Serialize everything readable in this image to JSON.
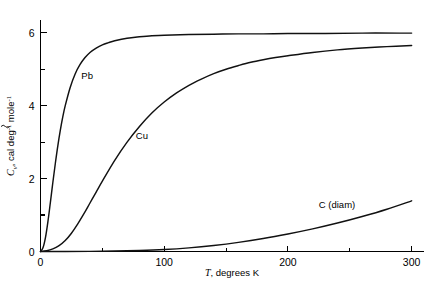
{
  "figure": {
    "name": "heat-capacity-vs-temperature",
    "background": "#ffffff",
    "curve_color": "#111111",
    "axis_color": "#000000"
  },
  "axes": {
    "x": {
      "label_italic": "T",
      "label_rest": ", degrees K",
      "label_full": "T, degrees K",
      "ticks": [
        "0",
        "100",
        "200",
        "300"
      ],
      "tick_values": [
        0,
        100,
        200,
        300
      ],
      "minor_values": [
        50,
        150,
        250
      ],
      "range": [
        0,
        310
      ]
    },
    "y": {
      "label_symbol": "C",
      "label_sub": "v",
      "label_rest": ", cal deg",
      "label_exp1": "-1",
      "label_mid": " mole",
      "label_exp2": "-1",
      "label_full": "C̃v, cal deg⁻¹ mole⁻¹",
      "ticks": [
        "0",
        "2",
        "4",
        "6"
      ],
      "tick_values": [
        0,
        2,
        4,
        6
      ],
      "minor_values": [
        1,
        3,
        5
      ],
      "range": [
        0,
        6.35
      ]
    }
  },
  "series_labels": {
    "lead": "Pb",
    "copper": "Cu",
    "diamond": "C (diam)"
  },
  "chart_data": {
    "type": "line",
    "title": "",
    "xlabel": "T, degrees K",
    "ylabel": "C̃v, cal deg⁻¹ mole⁻¹",
    "xlim": [
      0,
      310
    ],
    "ylim": [
      0,
      6.35
    ],
    "grid": false,
    "legend": "inline-annotations",
    "xticks": [
      0,
      100,
      200,
      300
    ],
    "yticks": [
      0,
      2,
      4,
      6
    ],
    "xticks_minor": [
      50,
      150,
      250
    ],
    "yticks_minor": [
      1,
      3,
      5
    ],
    "series": [
      {
        "name": "Pb",
        "label_position": {
          "x": 33,
          "y": 4.72
        },
        "x": [
          0,
          2,
          4,
          6,
          8,
          10,
          12,
          14,
          16,
          18,
          20,
          24,
          28,
          32,
          36,
          40,
          45,
          50,
          55,
          60,
          70,
          80,
          90,
          100,
          120,
          140,
          160,
          180,
          200,
          230,
          260,
          290,
          300
        ],
        "y": [
          0,
          0.1,
          0.38,
          0.82,
          1.35,
          1.9,
          2.42,
          2.9,
          3.32,
          3.69,
          4.0,
          4.5,
          4.87,
          5.13,
          5.32,
          5.46,
          5.58,
          5.67,
          5.73,
          5.78,
          5.85,
          5.89,
          5.92,
          5.93,
          5.95,
          5.96,
          5.97,
          5.97,
          5.98,
          5.98,
          5.99,
          5.99,
          5.99
        ]
      },
      {
        "name": "Cu",
        "label_position": {
          "x": 77,
          "y": 3.1
        },
        "x": [
          0,
          5,
          10,
          15,
          20,
          25,
          30,
          35,
          40,
          45,
          50,
          60,
          70,
          80,
          90,
          100,
          110,
          120,
          130,
          140,
          150,
          160,
          170,
          180,
          190,
          200,
          220,
          240,
          260,
          280,
          300
        ],
        "y": [
          0,
          0.02,
          0.07,
          0.16,
          0.3,
          0.5,
          0.75,
          1.03,
          1.33,
          1.63,
          1.93,
          2.5,
          3.0,
          3.43,
          3.8,
          4.1,
          4.35,
          4.56,
          4.73,
          4.88,
          5.0,
          5.1,
          5.19,
          5.26,
          5.32,
          5.37,
          5.46,
          5.53,
          5.58,
          5.62,
          5.65
        ]
      },
      {
        "name": "C (diam)",
        "label_position": {
          "x": 225,
          "y": 1.2
        },
        "x": [
          0,
          20,
          40,
          60,
          80,
          100,
          120,
          140,
          160,
          180,
          200,
          220,
          240,
          260,
          280,
          300
        ],
        "y": [
          0,
          0.001,
          0.004,
          0.012,
          0.028,
          0.055,
          0.1,
          0.165,
          0.25,
          0.355,
          0.48,
          0.62,
          0.78,
          0.96,
          1.16,
          1.39
        ]
      }
    ]
  }
}
